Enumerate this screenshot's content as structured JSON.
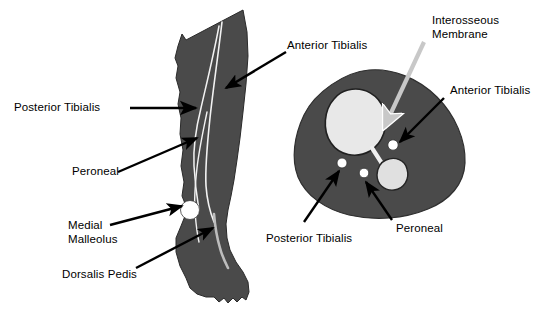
{
  "figure": {
    "background_color": "#ffffff",
    "text_color": "#000000",
    "tissue_color": "#4a4a4a",
    "bone_color": "#e8e8e8",
    "vessel_color": "#ffffff",
    "arrow_color": "#000000",
    "membrane_arrow_color": "#c8c8c8"
  },
  "labels": {
    "leg_posterior_tibialis": "Posterior Tibialis",
    "leg_peroneal": "Peroneal",
    "leg_medial_malleolus_line1": "Medial",
    "leg_medial_malleolus_line2": "Malleolus",
    "leg_dorsalis_pedis": "Dorsalis Pedis",
    "leg_anterior_tibialis": "Anterior Tibialis",
    "xsec_interosseous_line1": "Interosseous",
    "xsec_interosseous_line2": "Membrane",
    "xsec_anterior_tibialis": "Anterior Tibialis",
    "xsec_posterior_tibialis": "Posterior Tibialis",
    "xsec_peroneal": "Peroneal"
  },
  "structures": {
    "leg_view": {
      "name": "anterior leg and foot silhouette",
      "vessels": [
        "Anterior Tibialis",
        "Posterior Tibialis",
        "Peroneal",
        "Dorsalis Pedis"
      ],
      "landmark": "Medial Malleolus"
    },
    "cross_section_view": {
      "name": "mid-calf axial cross-section",
      "bones": [
        "Tibia",
        "Fibula"
      ],
      "connective": "Interosseous Membrane",
      "vessels": [
        "Anterior Tibialis",
        "Posterior Tibialis",
        "Peroneal"
      ]
    }
  }
}
